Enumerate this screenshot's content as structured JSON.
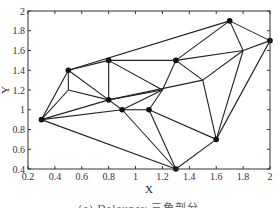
{
  "chart_data": {
    "type": "scatter",
    "title": "",
    "xlabel": "X",
    "ylabel": "Y",
    "xlim": [
      0.2,
      2
    ],
    "ylim": [
      0.4,
      2
    ],
    "x_ticks": [
      "0.2",
      "0.4",
      "0.6",
      "0.8",
      "1",
      "1.2",
      "1.4",
      "1.6",
      "1.8",
      "2"
    ],
    "y_ticks": [
      "0.4",
      "0.6",
      "0.8",
      "1",
      "1.2",
      "1.4",
      "1.6",
      "1.8",
      "2"
    ],
    "grid": false,
    "marked_points": [
      {
        "x": 0.3,
        "y": 0.9
      },
      {
        "x": 0.5,
        "y": 1.4
      },
      {
        "x": 0.8,
        "y": 1.5
      },
      {
        "x": 0.8,
        "y": 1.1
      },
      {
        "x": 0.9,
        "y": 1.0
      },
      {
        "x": 1.1,
        "y": 1.0
      },
      {
        "x": 1.3,
        "y": 0.4
      },
      {
        "x": 1.6,
        "y": 0.7
      },
      {
        "x": 1.3,
        "y": 1.5
      },
      {
        "x": 1.7,
        "y": 1.9
      },
      {
        "x": 2.0,
        "y": 1.7
      }
    ],
    "unmarked_vertices": [
      {
        "x": 0.5,
        "y": 1.2
      },
      {
        "x": 1.2,
        "y": 1.2
      },
      {
        "x": 1.5,
        "y": 1.3
      },
      {
        "x": 1.8,
        "y": 1.6
      }
    ],
    "edges": [
      [
        [
          0.3,
          0.9
        ],
        [
          0.5,
          1.4
        ]
      ],
      [
        [
          0.3,
          0.9
        ],
        [
          0.5,
          1.2
        ]
      ],
      [
        [
          0.3,
          0.9
        ],
        [
          0.8,
          1.1
        ]
      ],
      [
        [
          0.3,
          0.9
        ],
        [
          0.9,
          1.0
        ]
      ],
      [
        [
          0.3,
          0.9
        ],
        [
          1.3,
          0.4
        ]
      ],
      [
        [
          0.5,
          1.4
        ],
        [
          0.8,
          1.5
        ]
      ],
      [
        [
          0.5,
          1.4
        ],
        [
          1.7,
          1.9
        ]
      ],
      [
        [
          0.5,
          1.4
        ],
        [
          0.5,
          1.2
        ]
      ],
      [
        [
          0.5,
          1.4
        ],
        [
          0.8,
          1.1
        ]
      ],
      [
        [
          0.5,
          1.2
        ],
        [
          0.8,
          1.1
        ]
      ],
      [
        [
          0.8,
          1.5
        ],
        [
          0.8,
          1.1
        ]
      ],
      [
        [
          0.8,
          1.5
        ],
        [
          1.3,
          1.5
        ]
      ],
      [
        [
          0.8,
          1.5
        ],
        [
          1.2,
          1.2
        ]
      ],
      [
        [
          0.8,
          1.1
        ],
        [
          1.2,
          1.2
        ]
      ],
      [
        [
          0.8,
          1.1
        ],
        [
          1.5,
          1.3
        ]
      ],
      [
        [
          0.8,
          1.1
        ],
        [
          0.9,
          1.0
        ]
      ],
      [
        [
          0.9,
          1.0
        ],
        [
          1.1,
          1.0
        ]
      ],
      [
        [
          0.9,
          1.0
        ],
        [
          1.2,
          1.2
        ]
      ],
      [
        [
          0.9,
          1.0
        ],
        [
          1.3,
          0.4
        ]
      ],
      [
        [
          1.1,
          1.0
        ],
        [
          1.2,
          1.2
        ]
      ],
      [
        [
          1.1,
          1.0
        ],
        [
          1.3,
          0.4
        ]
      ],
      [
        [
          1.1,
          1.0
        ],
        [
          1.6,
          0.7
        ]
      ],
      [
        [
          1.2,
          1.2
        ],
        [
          1.3,
          1.5
        ]
      ],
      [
        [
          1.3,
          1.5
        ],
        [
          1.5,
          1.3
        ]
      ],
      [
        [
          1.3,
          1.5
        ],
        [
          1.7,
          1.9
        ]
      ],
      [
        [
          1.3,
          1.5
        ],
        [
          1.8,
          1.6
        ]
      ],
      [
        [
          1.5,
          1.3
        ],
        [
          1.8,
          1.6
        ]
      ],
      [
        [
          1.5,
          1.3
        ],
        [
          1.6,
          0.7
        ]
      ],
      [
        [
          1.7,
          1.9
        ],
        [
          1.8,
          1.6
        ]
      ],
      [
        [
          1.7,
          1.9
        ],
        [
          2.0,
          1.7
        ]
      ],
      [
        [
          1.8,
          1.6
        ],
        [
          2.0,
          1.7
        ]
      ],
      [
        [
          1.8,
          1.6
        ],
        [
          1.6,
          0.7
        ]
      ],
      [
        [
          2.0,
          1.7
        ],
        [
          1.6,
          0.7
        ]
      ],
      [
        [
          1.6,
          0.7
        ],
        [
          1.3,
          0.4
        ]
      ]
    ],
    "caption": "(a) Delaunay 三角剖分"
  }
}
